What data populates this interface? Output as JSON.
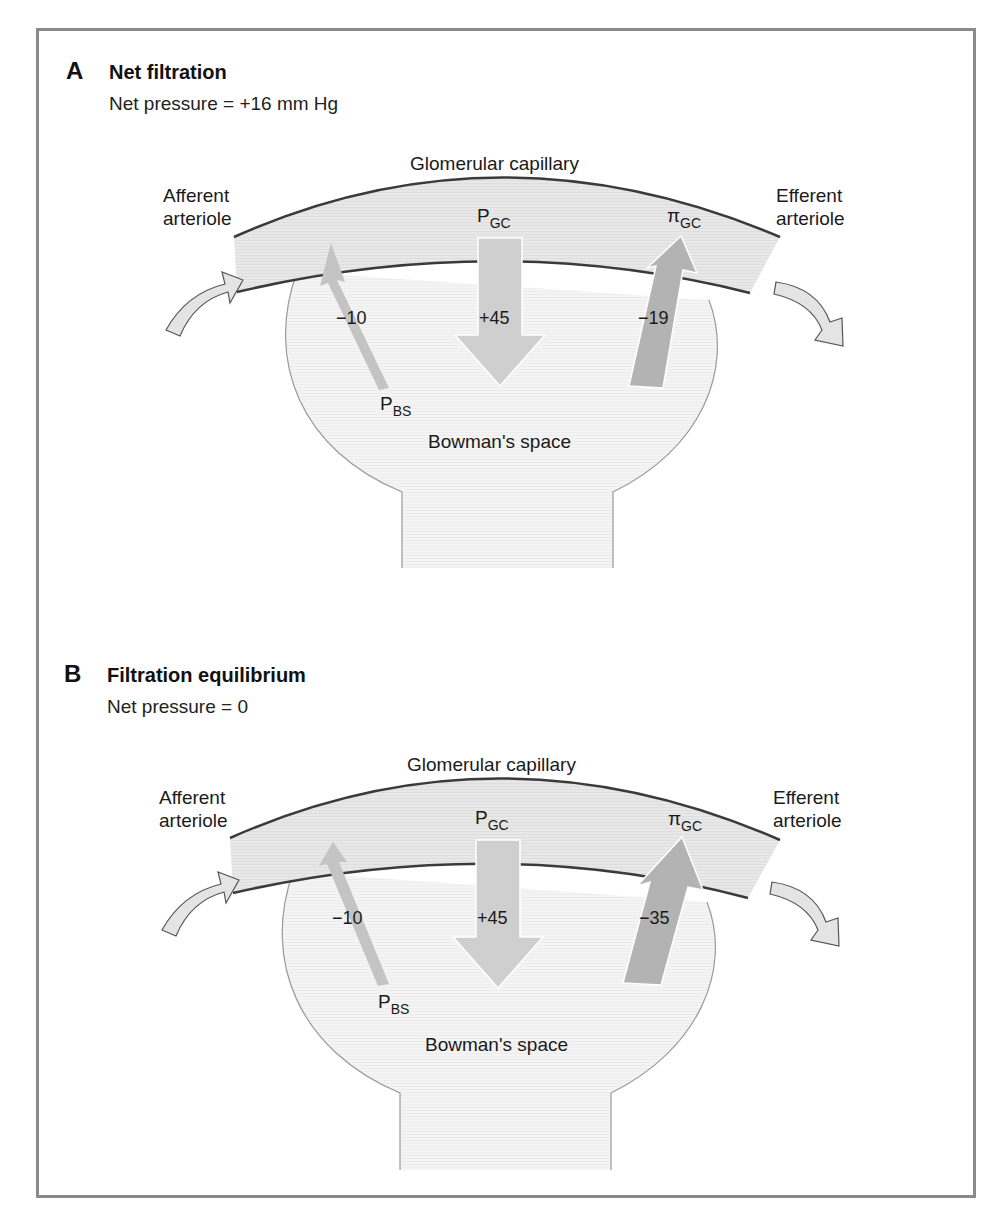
{
  "colors": {
    "frame": "#8a8a8a",
    "capillary_fill": "#e6e6e6",
    "capillary_wall": "#3a3a3a",
    "bowman_fill": "#f2f2f2",
    "bowman_wall": "#9a9a9a",
    "arrow_light": "#cfcfcf",
    "arrow_mid": "#c4c4c4",
    "arrow_dark": "#b3b3b3",
    "flow_arrow_fill": "#e4e4e4",
    "flow_arrow_stroke": "#555555"
  },
  "panels": [
    {
      "letter": "A",
      "title": "Net filtration",
      "subtitle": "Net pressure = +16 mm Hg",
      "capillary_label": "Glomerular capillary",
      "afferent_label": [
        "Afferent",
        "arteriole"
      ],
      "efferent_label": [
        "Efferent",
        "arteriole"
      ],
      "bowman_label": "Bowman's space",
      "forces": {
        "p_gc": {
          "symbol": "P",
          "subscript": "GC",
          "value": "+45",
          "direction": "down"
        },
        "p_bs": {
          "symbol": "P",
          "subscript": "BS",
          "value": "−10",
          "direction": "up"
        },
        "pi_gc": {
          "symbol": "π",
          "subscript": "GC",
          "value": "−19",
          "direction": "up"
        }
      }
    },
    {
      "letter": "B",
      "title": "Filtration equilibrium",
      "subtitle": "Net pressure = 0",
      "capillary_label": "Glomerular capillary",
      "afferent_label": [
        "Afferent",
        "arteriole"
      ],
      "efferent_label": [
        "Efferent",
        "arteriole"
      ],
      "bowman_label": "Bowman's space",
      "forces": {
        "p_gc": {
          "symbol": "P",
          "subscript": "GC",
          "value": "+45",
          "direction": "down"
        },
        "p_bs": {
          "symbol": "P",
          "subscript": "BS",
          "value": "−10",
          "direction": "up"
        },
        "pi_gc": {
          "symbol": "π",
          "subscript": "GC",
          "value": "−35",
          "direction": "up"
        }
      }
    }
  ]
}
